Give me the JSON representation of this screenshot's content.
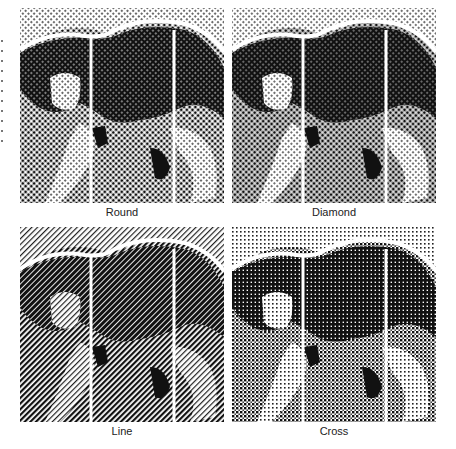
{
  "figure": {
    "panels": [
      {
        "label": "Round",
        "screen": "round"
      },
      {
        "label": "Diamond",
        "screen": "diamond"
      },
      {
        "label": "Line",
        "screen": "line"
      },
      {
        "label": "Cross",
        "screen": "cross"
      }
    ]
  }
}
